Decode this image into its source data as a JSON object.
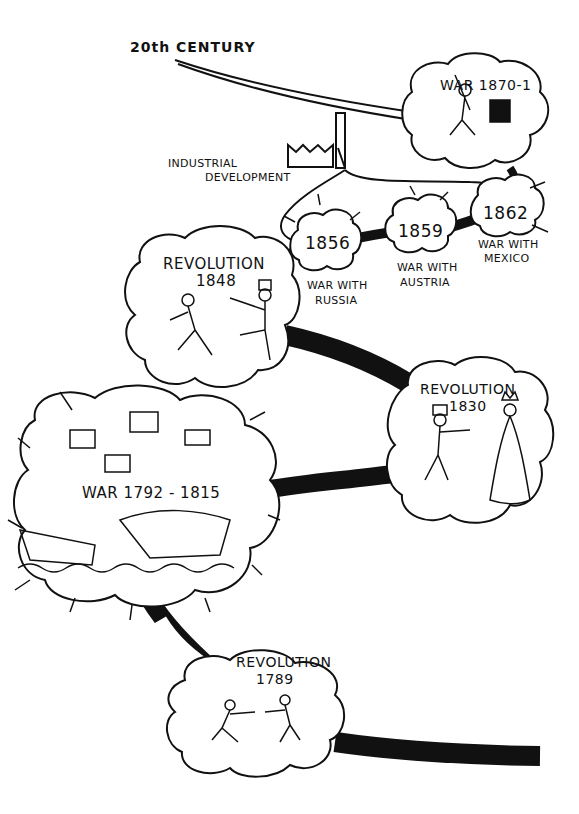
{
  "title": "20th CENTURY",
  "industrial": {
    "label_line1": "INDUSTRIAL",
    "label_line2": "DEVELOPMENT",
    "icon": "factory-icon"
  },
  "events": [
    {
      "id": "rev1789",
      "title": "REVOLUTION",
      "year": "1789",
      "kind": "revolution"
    },
    {
      "id": "war1792",
      "title": "WAR",
      "year": "1792 - 1815",
      "kind": "war"
    },
    {
      "id": "rev1830",
      "title": "REVOLUTION",
      "year": "1830",
      "kind": "revolution"
    },
    {
      "id": "rev1848",
      "title": "REVOLUTION",
      "year": "1848",
      "kind": "revolution"
    },
    {
      "id": "war1856",
      "year": "1856",
      "caption_line1": "WAR WITH",
      "caption_line2": "RUSSIA",
      "kind": "war"
    },
    {
      "id": "war1859",
      "year": "1859",
      "caption_line1": "WAR WITH",
      "caption_line2": "AUSTRIA",
      "kind": "war"
    },
    {
      "id": "war1862",
      "year": "1862",
      "caption_line1": "WAR WITH",
      "caption_line2": "MEXICO",
      "kind": "war"
    },
    {
      "id": "war1870",
      "title": "WAR",
      "year": "1870-1",
      "kind": "war"
    }
  ],
  "colors": {
    "ink": "#111111",
    "paper": "#ffffff"
  }
}
